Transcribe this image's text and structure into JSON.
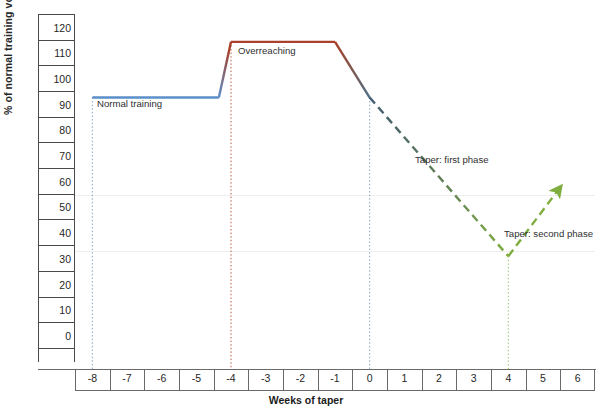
{
  "chart_data": {
    "type": "line",
    "title": "",
    "xlabel": "Weeks of taper",
    "ylabel": "% of normal training volume",
    "xlim": [
      -8.5,
      6.5
    ],
    "ylim": [
      0,
      125
    ],
    "x_ticks": [
      "-8",
      "-7",
      "-6",
      "-5",
      "-4",
      "-3",
      "-2",
      "-1",
      "0",
      "1",
      "2",
      "3",
      "4",
      "5",
      "6"
    ],
    "y_ticks": [
      "0",
      "10",
      "20",
      "30",
      "40",
      "50",
      "60",
      "70",
      "80",
      "90",
      "100",
      "110",
      "120"
    ],
    "grid": "horizontal-faint at 40 and 60",
    "legend": "none (inline annotations)",
    "series": [
      {
        "name": "Normal training",
        "style": "solid",
        "color": "#5b8fc9",
        "points": [
          {
            "x": -8,
            "y": 95
          },
          {
            "x": -4.35,
            "y": 95
          }
        ]
      },
      {
        "name": "Ramp to overreaching",
        "style": "solid",
        "color_from": "#5b8fc9",
        "color_to": "#a8402a",
        "points": [
          {
            "x": -4.35,
            "y": 95
          },
          {
            "x": -4,
            "y": 115
          }
        ]
      },
      {
        "name": "Overreaching",
        "style": "solid",
        "color": "#a8402a",
        "points": [
          {
            "x": -4,
            "y": 115
          },
          {
            "x": -1,
            "y": 115
          }
        ]
      },
      {
        "name": "Descent to taper",
        "style": "solid",
        "color_from": "#a8402a",
        "color_to": "#4e6f87",
        "points": [
          {
            "x": -1,
            "y": 115
          },
          {
            "x": 0,
            "y": 95
          }
        ]
      },
      {
        "name": "Taper: first phase",
        "style": "dashed",
        "color_from": "#3f5a70",
        "color_to": "#7fad3f",
        "points": [
          {
            "x": 0,
            "y": 95
          },
          {
            "x": 4,
            "y": 38
          }
        ]
      },
      {
        "name": "Taper: second phase",
        "style": "dashed-arrow",
        "color": "#7fad3f",
        "points": [
          {
            "x": 4,
            "y": 38
          },
          {
            "x": 5.45,
            "y": 62
          }
        ]
      }
    ],
    "vertical_markers": [
      {
        "x": -8,
        "color": "#7f9fc4",
        "style": "dotted",
        "from_y": 0,
        "to_y": 95
      },
      {
        "x": -4,
        "color": "#b4543c",
        "style": "dotted",
        "from_y": 0,
        "to_y": 115
      },
      {
        "x": 0,
        "color": "#7f9fc4",
        "style": "dotted",
        "from_y": 0,
        "to_y": 95
      },
      {
        "x": 4,
        "color": "#9bbd6b",
        "style": "dotted",
        "from_y": 0,
        "to_y": 38
      }
    ],
    "annotations": [
      {
        "text": "Normal training",
        "x": -7.2,
        "y": 88
      },
      {
        "text": "Overreaching",
        "x": -3.6,
        "y": 110
      },
      {
        "text": "Taper: first phase",
        "x": 1.6,
        "y": 65
      },
      {
        "text": "Taper: second phase",
        "x": 4.6,
        "y": 47
      }
    ]
  },
  "axes": {
    "y_title": "% of normal training volume",
    "x_title": "Weeks of taper",
    "y_ticks": [
      "120",
      "110",
      "100",
      "90",
      "80",
      "70",
      "60",
      "50",
      "40",
      "30",
      "20",
      "10",
      "0"
    ],
    "x_ticks": [
      "-8",
      "-7",
      "-6",
      "-5",
      "-4",
      "-3",
      "-2",
      "-1",
      "0",
      "1",
      "2",
      "3",
      "4",
      "5",
      "6"
    ]
  },
  "annotations": {
    "normal_training": "Normal training",
    "overreaching": "Overreaching",
    "taper_first": "Taper: first phase",
    "taper_second": "Taper: second phase"
  },
  "colors": {
    "normal": "#5b8fc9",
    "overreaching": "#a8402a",
    "taper_descent": "#4e6f87",
    "taper_green": "#7fad3f",
    "axis": "#4a4a4a",
    "grid": "#eeeeee"
  }
}
